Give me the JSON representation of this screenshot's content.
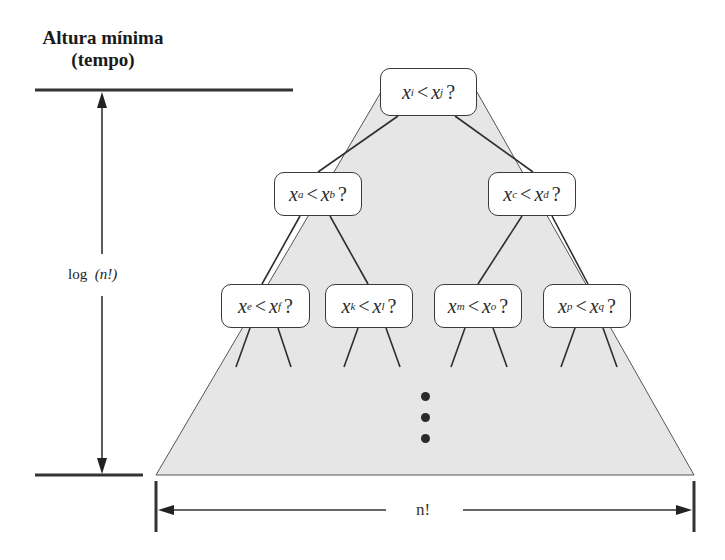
{
  "diagram": {
    "title_line1": "Altura mínima",
    "title_line2": "(tempo)",
    "height_label": "log  (n!)",
    "height_label_func": "log",
    "height_label_arg": "(n!)",
    "width_label": "n!",
    "colors": {
      "triangle_fill": "#e6e6e6",
      "stroke": "#333333",
      "node_fill": "#ffffff"
    },
    "nodes": [
      {
        "level": 0,
        "left": "x",
        "left_sub": "i",
        "op": "<",
        "right": "x",
        "right_sub": "j",
        "q": "?"
      },
      {
        "level": 1,
        "left": "x",
        "left_sub": "a",
        "op": "<",
        "right": "x",
        "right_sub": "b",
        "q": "?"
      },
      {
        "level": 1,
        "left": "x",
        "left_sub": "c",
        "op": "<",
        "right": "x",
        "right_sub": "d",
        "q": "?"
      },
      {
        "level": 2,
        "left": "x",
        "left_sub": "e",
        "op": "<",
        "right": "x",
        "right_sub": "f",
        "q": "?"
      },
      {
        "level": 2,
        "left": "x",
        "left_sub": "k",
        "op": "<",
        "right": "x",
        "right_sub": "l",
        "q": "?"
      },
      {
        "level": 2,
        "left": "x",
        "left_sub": "m",
        "op": "<",
        "right": "x",
        "right_sub": "o",
        "q": "?"
      },
      {
        "level": 2,
        "left": "x",
        "left_sub": "p",
        "op": "<",
        "right": "x",
        "right_sub": "q",
        "q": "?"
      }
    ],
    "continuation": "⋮"
  }
}
